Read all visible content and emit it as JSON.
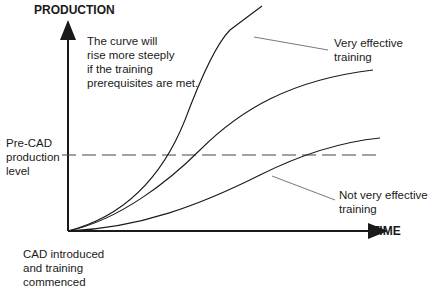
{
  "diagram": {
    "y_axis_label": "PRODUCTION",
    "x_axis_label": "TIME",
    "note": "The curve will\nrise more steeply\nif the training\nprerequisites are met.",
    "baseline_label": "Pre-CAD\nproduction\nlevel",
    "origin_label": "CAD introduced\nand training\ncommenced",
    "curve_label_effective": "Very effective\ntraining",
    "curve_label_not_effective": "Not very effective\ntraining",
    "colors": {
      "line": "#1a1a1a",
      "leader": "#555555",
      "dashed": "#444444"
    }
  }
}
